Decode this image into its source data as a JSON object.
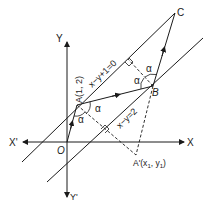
{
  "figure": {
    "axes": {
      "x_pos_label": "X",
      "x_neg_label": "X'",
      "y_pos_label": "Y",
      "y_neg_label": "Y'",
      "origin_label": "O"
    },
    "lines": [
      {
        "id": "line1",
        "equation": "x−y+1=0"
      },
      {
        "id": "line2",
        "equation": "x−y=2"
      }
    ],
    "points": {
      "A": "A(1, 2)",
      "B": "B",
      "C": "C",
      "A_prime": "A'(x",
      "A_prime_sub1": "1",
      "A_prime_mid": ", y",
      "A_prime_sub2": "1",
      "A_prime_end": ")"
    },
    "angle_label": "α",
    "colors": {
      "stroke": "#1a1a1a",
      "background": "#ffffff"
    }
  }
}
